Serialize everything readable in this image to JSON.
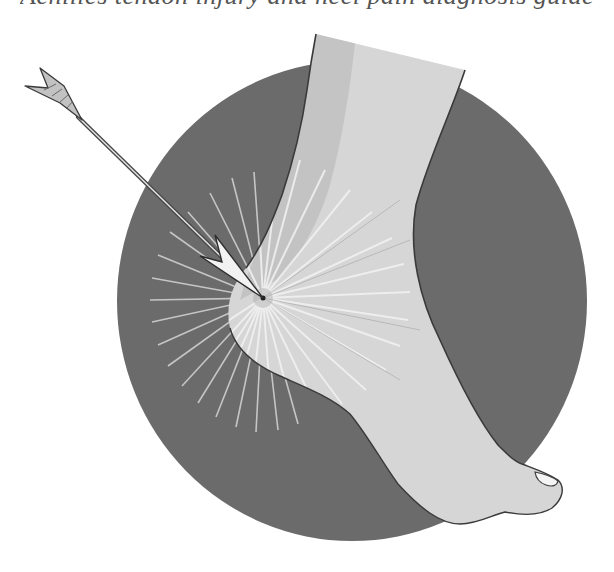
{
  "caption": {
    "text": "Achilles tendon injury and heel pain diagnosis guide",
    "note": "clipped at top edge; only descenders visible"
  },
  "illustration": {
    "subject": "arrow striking the heel of a foot (Achilles heel)",
    "background_disc": {
      "color": "#6b6b6b",
      "cx": 352,
      "cy": 301,
      "rx": 235,
      "ry": 240
    },
    "foot": {
      "fill": "#d6d6d6",
      "shade": "#c4c4c4",
      "outline": "#3a3a3a",
      "toenail_fill": "#f4f4f4"
    },
    "impact_point": {
      "x": 263,
      "y": 298,
      "ray_color": "#f0f0f0",
      "ray_count": 36
    },
    "arrow": {
      "shaft_color": "#5a5a5a",
      "shaft_highlight": "#e8e8e8",
      "fletching_color": "#bdbdbd",
      "head_color": "#f2f2f2",
      "tail": {
        "x": 80,
        "y": 118
      },
      "tip": {
        "x": 263,
        "y": 298
      }
    },
    "icons": [
      "arrow-icon",
      "foot-icon",
      "impact-burst-icon"
    ]
  }
}
